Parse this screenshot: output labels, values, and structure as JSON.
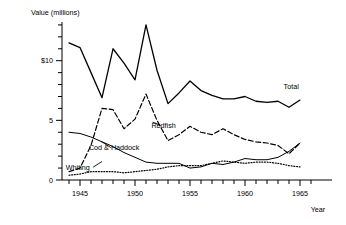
{
  "chart_data": {
    "type": "line",
    "title": "",
    "ylabel": "Value (millions)",
    "xlabel": "Year",
    "ylim": [
      0,
      14
    ],
    "xlim": [
      1943.5,
      1966.5
    ],
    "grid": false,
    "legend": "inline-labels",
    "y_tick_labels": [
      {
        "value": 0,
        "text": "0"
      },
      {
        "value": 5,
        "text": "5"
      },
      {
        "value": 10,
        "text": "$10"
      }
    ],
    "y_minor_tick_step": 1,
    "x_tick_labels": [
      {
        "value": 1945,
        "text": "1945"
      },
      {
        "value": 1950,
        "text": "1950"
      },
      {
        "value": 1955,
        "text": "1955"
      },
      {
        "value": 1960,
        "text": "1960"
      },
      {
        "value": 1965,
        "text": "1965"
      }
    ],
    "x_minor_tick_step": 1,
    "x": [
      1944,
      1945,
      1946,
      1947,
      1948,
      1949,
      1950,
      1951,
      1952,
      1953,
      1954,
      1955,
      1956,
      1957,
      1958,
      1959,
      1960,
      1961,
      1962,
      1963,
      1964,
      1965
    ],
    "series": [
      {
        "name": "Total",
        "style": "solid",
        "label_x": 1964.2,
        "label_y": 7.6,
        "values": [
          11.5,
          11.1,
          9.0,
          6.9,
          11.0,
          9.8,
          8.4,
          13.0,
          9.2,
          6.4,
          7.3,
          8.3,
          7.5,
          7.1,
          6.8,
          6.8,
          7.0,
          6.6,
          6.5,
          6.6,
          6.1,
          6.7
        ]
      },
      {
        "name": "Redfish",
        "style": "dashed",
        "label_x": 1952.6,
        "label_y": 4.4,
        "values": [
          0.7,
          1.0,
          2.9,
          6.0,
          5.9,
          4.3,
          5.1,
          7.2,
          5.0,
          3.3,
          3.8,
          4.5,
          4.0,
          3.8,
          4.3,
          3.8,
          3.4,
          3.2,
          3.1,
          2.9,
          2.2,
          3.1
        ]
      },
      {
        "name": "Cod & Haddock",
        "style": "solid-thin",
        "label_x": 1948.1,
        "label_y": 2.5,
        "values": [
          4.0,
          3.9,
          3.6,
          3.2,
          2.8,
          2.3,
          1.9,
          1.5,
          1.4,
          1.4,
          1.4,
          1.0,
          1.1,
          1.4,
          1.3,
          1.5,
          1.8,
          1.7,
          1.7,
          1.9,
          2.4,
          3.1
        ]
      },
      {
        "name": "Whiting",
        "style": "dotted",
        "label_x": 1944.8,
        "label_y": 0.85,
        "values": [
          0.4,
          0.5,
          0.7,
          0.7,
          0.7,
          0.6,
          0.7,
          0.8,
          0.9,
          1.1,
          1.2,
          1.2,
          1.2,
          1.4,
          1.6,
          1.5,
          1.4,
          1.5,
          1.5,
          1.4,
          1.2,
          1.1
        ]
      }
    ]
  }
}
